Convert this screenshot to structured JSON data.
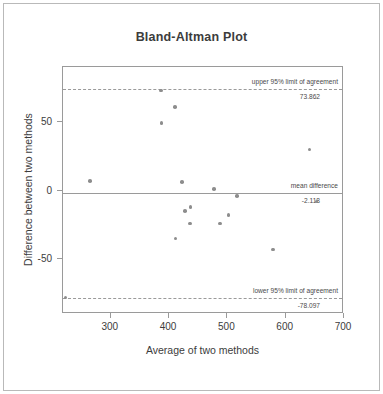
{
  "chart_data": {
    "type": "scatter",
    "title": "Bland-Altman Plot",
    "xlabel": "Average of two methods",
    "ylabel": "Difference between two methods",
    "xlim": [
      218,
      700
    ],
    "ylim": [
      -90,
      90
    ],
    "xticks": [
      300,
      400,
      500,
      600,
      700
    ],
    "yticks": [
      50,
      0,
      -50
    ],
    "grid": false,
    "legend": "none",
    "points": [
      {
        "x": 264,
        "y": 7
      },
      {
        "x": 386,
        "y": 73
      },
      {
        "x": 410,
        "y": 61
      },
      {
        "x": 387,
        "y": 49
      },
      {
        "x": 641,
        "y": 30
      },
      {
        "x": 422,
        "y": 6
      },
      {
        "x": 477,
        "y": 1
      },
      {
        "x": 516,
        "y": -4
      },
      {
        "x": 653,
        "y": -8
      },
      {
        "x": 437,
        "y": -12
      },
      {
        "x": 427,
        "y": -15
      },
      {
        "x": 502,
        "y": -18
      },
      {
        "x": 436,
        "y": -24
      },
      {
        "x": 487,
        "y": -24
      },
      {
        "x": 411,
        "y": -35
      },
      {
        "x": 578,
        "y": -43
      },
      {
        "x": 222,
        "y": -78
      }
    ],
    "reference_lines": [
      {
        "id": "upper-limit",
        "label": "upper 95% limit of agreement",
        "value": 73.862,
        "value_label": "73.862",
        "style": "dashed"
      },
      {
        "id": "mean-difference",
        "label": "mean difference",
        "value": -2.118,
        "value_label": "-2.118",
        "style": "solid"
      },
      {
        "id": "lower-limit",
        "label": "lower 95% limit of agreement",
        "value": -78.097,
        "value_label": "-78.097",
        "style": "dashed"
      }
    ],
    "colors": {
      "point": "#8d8d8d",
      "line": "#9a9a9a",
      "text": "#3c3c3c",
      "frame": "#b9b9b9"
    }
  }
}
